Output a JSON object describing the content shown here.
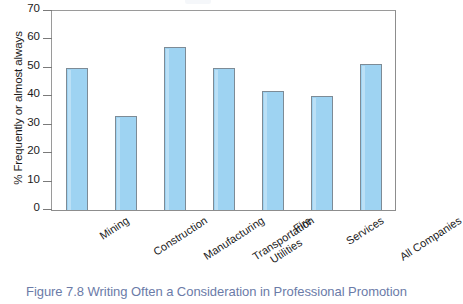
{
  "caption": "Figure 7.8  Writing Often a Consideration in Professional Promotion",
  "colors": {
    "bar_fill": "#9ed3f2",
    "bar_border": "#7d8b96",
    "frame": "#9a9a9a",
    "caption": "#6b7ba8",
    "text": "#1b1b1b"
  },
  "chart_data": {
    "type": "bar",
    "title": "",
    "subtitle": "",
    "xlabel": "",
    "ylabel": "% Frequently or almost always",
    "categories": [
      "Mining",
      "Construction",
      "Manufacturing",
      "Transportation Utilities",
      "Fire",
      "Services",
      "All Companies"
    ],
    "category_lines": [
      [
        "Mining"
      ],
      [
        "Construction"
      ],
      [
        "Manufacturing"
      ],
      [
        "Transportation",
        "Utilities"
      ],
      [
        "Fire"
      ],
      [
        "Services"
      ],
      [
        "All Companies"
      ]
    ],
    "values": [
      50,
      33,
      57.5,
      50,
      42,
      40,
      51.5
    ],
    "ylim": [
      0,
      70
    ],
    "yticks": [
      0,
      10,
      20,
      30,
      40,
      50,
      60,
      70
    ],
    "ytick_labels": [
      "0",
      "10",
      "20",
      "30",
      "40",
      "50",
      "60",
      "70"
    ],
    "grid": false,
    "legend": false,
    "legend_position": "none"
  }
}
